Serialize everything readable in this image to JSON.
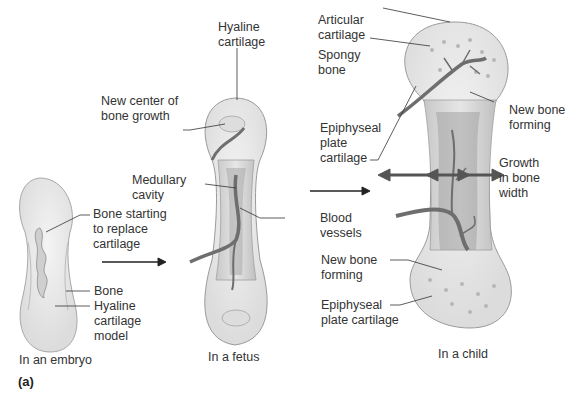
{
  "figure": {
    "panel_label": "(a)",
    "stages": [
      {
        "caption": "In an embryo",
        "labels": {
          "bone_starting": "Bone starting\nto replace\ncartilage",
          "bone": "Bone",
          "hyaline_model": "Hyaline\ncartilage\nmodel"
        }
      },
      {
        "caption": "In a fetus",
        "labels": {
          "hyaline_cartilage": "Hyaline\ncartilage",
          "new_center": "New center of\nbone growth",
          "medullary_cavity": "Medullary\ncavity"
        }
      },
      {
        "caption": "In a child",
        "labels": {
          "articular_cartilage": "Articular\ncartilage",
          "spongy_bone": "Spongy\nbone",
          "epiphyseal_top": "Epiphyseal\nplate\ncartilage",
          "new_bone_top": "New bone\nforming",
          "growth_width": "Growth\nin bone\nwidth",
          "new_bone_bottom": "New bone\nforming",
          "epiphyseal_bottom": "Epiphyseal\nplate cartilage"
        }
      }
    ],
    "shared_labels": {
      "blood_vessels": "Blood\nvessels"
    },
    "colors": {
      "cartilage": "#ebebeb",
      "bone_outline": "#9a9a9a",
      "bone_shaft": "#d6d6d6",
      "vessel": "#6e6e6e",
      "arrow": "#555555",
      "leader": "#333333"
    }
  }
}
